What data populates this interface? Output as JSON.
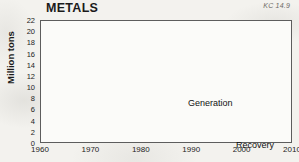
{
  "title": "METALS",
  "corner_code": "KC 14.9",
  "labels": {
    "generation": "Generation",
    "recovery": "Recovery"
  },
  "colors": {
    "generation_fill": "#9a9a9a",
    "recovery_fill": "#c9c9c7",
    "axis": "#5d5d5d",
    "gridline": "#c2c2c0",
    "plot_bg": "#fbfbf9",
    "page_bg": "#f3f2ee",
    "text": "#1b1b1b"
  },
  "chart_data": {
    "type": "area",
    "stacked": true,
    "title": "METALS",
    "xlabel": "",
    "ylabel": "Million tons",
    "xlim": [
      1960,
      2010
    ],
    "ylim": [
      0,
      22
    ],
    "grid": "horizontal",
    "legend": "inline-annotations",
    "xticks": [
      1960,
      1970,
      1980,
      1990,
      2000,
      2010
    ],
    "yticks": [
      0,
      2,
      4,
      6,
      8,
      10,
      12,
      14,
      16,
      18,
      20,
      22
    ],
    "x": [
      1960,
      1961,
      1962,
      1963,
      1964,
      1965,
      1966,
      1967,
      1968,
      1969,
      1970,
      1971,
      1972,
      1973,
      1974,
      1975,
      1976,
      1977,
      1978,
      1979,
      1980,
      1981,
      1982,
      1983,
      1984,
      1985,
      1986,
      1987,
      1988,
      1989,
      1990,
      1991,
      1992,
      1993,
      1994,
      1995,
      1996,
      1997,
      1998,
      1999,
      2000,
      2001,
      2002,
      2003,
      2004,
      2005,
      2006,
      2007,
      2008,
      2009,
      2010
    ],
    "series": [
      {
        "name": "Recovery",
        "values": [
          0.4,
          0.4,
          0.5,
          0.5,
          0.6,
          0.6,
          0.7,
          0.7,
          0.8,
          0.8,
          0.9,
          0.9,
          1.0,
          1.0,
          1.1,
          1.1,
          1.2,
          1.2,
          1.3,
          1.4,
          1.5,
          1.5,
          1.6,
          1.6,
          1.7,
          1.8,
          1.9,
          2.0,
          2.6,
          3.3,
          3.9,
          4.3,
          4.7,
          5.0,
          5.2,
          5.4,
          5.5,
          5.6,
          5.7,
          5.8,
          6.0,
          6.1,
          6.2,
          6.3,
          6.5,
          6.7,
          6.9,
          7.1,
          7.2,
          7.3,
          7.5
        ]
      },
      {
        "name": "Generation",
        "values": [
          11.0,
          11.0,
          11.0,
          11.1,
          11.2,
          12.3,
          12.6,
          12.8,
          13.1,
          13.3,
          13.4,
          13.5,
          13.7,
          13.9,
          14.0,
          14.0,
          14.1,
          14.2,
          14.3,
          14.4,
          14.8,
          14.6,
          16.0,
          14.6,
          14.8,
          15.0,
          15.2,
          15.4,
          15.6,
          16.0,
          16.2,
          16.1,
          16.3,
          16.8,
          16.6,
          16.3,
          16.2,
          16.2,
          16.3,
          17.2,
          18.4,
          19.2,
          19.2,
          19.4,
          19.6,
          19.9,
          20.2,
          20.5,
          20.7,
          20.9,
          21.1
        ]
      }
    ],
    "annotations": [
      {
        "text": "Generation",
        "x": 1996,
        "y": 12.5
      },
      {
        "text": "Recovery",
        "x": 2002,
        "y": 3.5
      },
      {
        "text": "KC 14.9",
        "position": "top-right"
      }
    ]
  }
}
